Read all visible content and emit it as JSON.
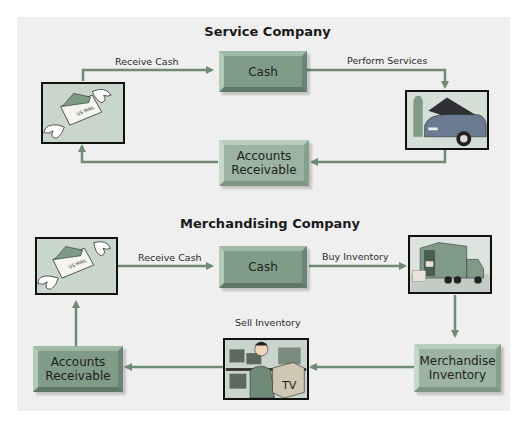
{
  "colors": {
    "panel_bg": "#efefef",
    "arrow": "#6f8a76",
    "box_dark": "#7f9d86",
    "box_light": "#9cb3a1"
  },
  "service": {
    "title": "Service Company",
    "nodes": {
      "cash": "Cash",
      "accounts_receivable_line1": "Accounts",
      "accounts_receivable_line2": "Receivable",
      "mail_icon": "us-mail-with-wings",
      "service_icon": "mechanic-with-car"
    },
    "mail_text": "US MAIL",
    "edges": {
      "receive_cash": "Receive Cash",
      "perform_services": "Perform Services"
    }
  },
  "merchandising": {
    "title": "Merchandising Company",
    "nodes": {
      "cash": "Cash",
      "accounts_receivable_line1": "Accounts",
      "accounts_receivable_line2": "Receivable",
      "merchandise_inventory_line1": "Merchandise",
      "merchandise_inventory_line2": "Inventory",
      "mail_icon": "us-mail-with-wings",
      "truck_icon": "delivery-truck",
      "sale_icon": "salesman-with-tv"
    },
    "mail_text": "US MAIL",
    "tv_text": "TV",
    "edges": {
      "receive_cash": "Receive Cash",
      "buy_inventory": "Buy Inventory",
      "sell_inventory": "Sell Inventory"
    }
  }
}
